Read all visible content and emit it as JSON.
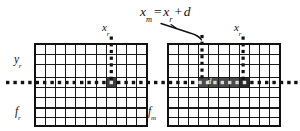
{
  "figure": {
    "type": "diagram",
    "background_color": "#ffffff",
    "ink_color": "#111111",
    "highlight_color": "#3d3d3d"
  },
  "equation": {
    "lhs_var": "x",
    "lhs_sub": "m",
    "equals": "=",
    "rhs_var": "x",
    "rhs_sub": "r",
    "plus": "+",
    "disparity": "d",
    "full_text": "x_m = x_r + d"
  },
  "labels": {
    "y_axis": {
      "var": "y",
      "sub": "r"
    },
    "left_image": {
      "var": "f",
      "sub": "r"
    },
    "right_image": {
      "var": "f",
      "sub": "m"
    },
    "left_column": {
      "var": "x",
      "sub": "r"
    },
    "right_column": {
      "var": "x",
      "sub": "r"
    },
    "disparity_band": "d"
  },
  "grids": {
    "left": {
      "name": "reference-image-grid",
      "label_var": "f",
      "label_sub": "r",
      "columns": 11,
      "rows": 8,
      "x": 35,
      "y": 44,
      "width": 112,
      "height": 82,
      "marked_column_index": 7,
      "scanline_row_index": 3
    },
    "right": {
      "name": "matching-image-grid",
      "label_var": "f",
      "label_sub": "m",
      "columns": 11,
      "rows": 8,
      "x": 168,
      "y": 44,
      "width": 112,
      "height": 82,
      "marked_column_index": 7,
      "band_start_index": 3,
      "band_end_index": 8,
      "scanline_row_index": 3
    }
  },
  "scanline": {
    "name": "epipolar-scanline",
    "style": "dotted",
    "y": 85,
    "x_start": 6,
    "x_end": 296,
    "dot_size": 3.2,
    "dot_spacing": 7.4
  },
  "vertical_markers": [
    {
      "name": "left-xr-marker",
      "x": 109,
      "y_top": 36,
      "y_bottom": 80
    },
    {
      "name": "mid-xm-marker",
      "x": 201,
      "y_top": 34,
      "y_bottom": 80
    },
    {
      "name": "right-xr-marker",
      "x": 245,
      "y_top": 36,
      "y_bottom": 80
    }
  ],
  "leader_line": {
    "name": "equation-leader-line",
    "from_x": 160,
    "from_y": 24,
    "to_x": 201,
    "to_y": 36
  }
}
